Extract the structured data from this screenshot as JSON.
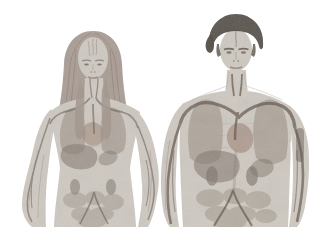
{
  "scene": {
    "background_color": "#ffffff",
    "style": "grainy photographic medical illustration, desaturated warm gray tones, figures cropped at the hips",
    "figures": [
      {
        "id": "female",
        "label": "woman with long hair",
        "position": "left",
        "visible_anatomy": [
          "forehead vessels",
          "carotid arteries",
          "lungs",
          "heart",
          "liver",
          "stomach",
          "kidneys",
          "intestines",
          "iliac vessels",
          "arm arteries"
        ]
      },
      {
        "id": "male",
        "label": "man with short dark hair",
        "position": "right",
        "visible_anatomy": [
          "forehead vessel",
          "carotid arteries",
          "subclavian artery arches",
          "lungs",
          "heart",
          "liver",
          "spleen",
          "kidneys",
          "intestines",
          "iliac arteries",
          "arm arteries"
        ]
      }
    ]
  },
  "colors": {
    "background": "#ffffff",
    "skin": "#cfc9c1",
    "skin_shadow": "#a8a098",
    "organ": "#8f8377",
    "organ_dark": "#746a60",
    "liver": "#7e7066",
    "heart": "#9b7f70",
    "artery": "#5c4f46",
    "vein": "#83766a",
    "hair_female": "#a2948a",
    "hair_female_dark": "#847567",
    "hair_male": "#4e463e",
    "face_feature": "#7d7166"
  }
}
